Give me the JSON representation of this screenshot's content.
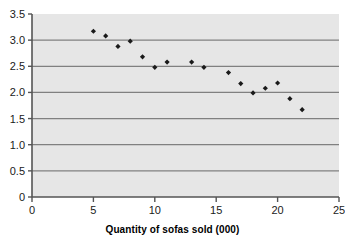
{
  "chart_data": {
    "type": "scatter",
    "title": "",
    "subtitle": "",
    "xlabel": "Quantity of sofas sold (000)",
    "ylabel": "",
    "xlim": [
      0,
      25
    ],
    "ylim": [
      0,
      3.5
    ],
    "xticks": [
      "0",
      "5",
      "10",
      "15",
      "20",
      "25"
    ],
    "xtick_values": [
      0,
      5,
      10,
      15,
      20,
      25
    ],
    "yticks": [
      "0",
      "0.5",
      "1.0",
      "1.5",
      "2.0",
      "2.5",
      "3.0",
      "3.5"
    ],
    "ytick_values": [
      0,
      0.5,
      1.0,
      1.5,
      2.0,
      2.5,
      3.0,
      3.5
    ],
    "grid": true,
    "grid_axis": "y",
    "legend": false,
    "legend_position": "none",
    "marker": "diamond",
    "marker_color": "#1a1a1a",
    "plot_background": "#e6e6e6",
    "gridline_color": "#808080",
    "axis_color": "#555555",
    "x": [
      5,
      6,
      7,
      8,
      9,
      10,
      11,
      13,
      14,
      16,
      17,
      18,
      19,
      20,
      21,
      22
    ],
    "y": [
      3.17,
      3.08,
      2.88,
      2.98,
      2.68,
      2.48,
      2.58,
      2.58,
      2.48,
      2.38,
      2.17,
      1.99,
      2.08,
      2.18,
      1.88,
      1.67
    ],
    "points": [
      {
        "x": 5,
        "y": 3.17
      },
      {
        "x": 6,
        "y": 3.08
      },
      {
        "x": 7,
        "y": 2.88
      },
      {
        "x": 8,
        "y": 2.98
      },
      {
        "x": 9,
        "y": 2.68
      },
      {
        "x": 10,
        "y": 2.48
      },
      {
        "x": 11,
        "y": 2.58
      },
      {
        "x": 13,
        "y": 2.58
      },
      {
        "x": 14,
        "y": 2.48
      },
      {
        "x": 16,
        "y": 2.38
      },
      {
        "x": 17,
        "y": 2.17
      },
      {
        "x": 18,
        "y": 1.99
      },
      {
        "x": 19,
        "y": 2.08
      },
      {
        "x": 20,
        "y": 2.18
      },
      {
        "x": 21,
        "y": 1.88
      },
      {
        "x": 22,
        "y": 1.67
      }
    ]
  }
}
